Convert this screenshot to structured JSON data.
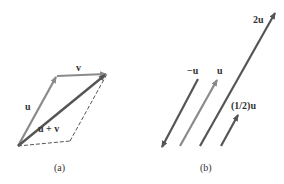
{
  "figure": {
    "panel_a": {
      "caption": "(a)",
      "labels": {
        "u": "u",
        "v": "v",
        "sum": "u + v"
      },
      "colors": {
        "u": "#8a8a8a",
        "v": "#8a8a8a",
        "sum": "#555555",
        "dashed": "#555555"
      }
    },
    "panel_b": {
      "caption": "(b)",
      "labels": {
        "neg_u": "−u",
        "u": "u",
        "two_u": "2u",
        "half_u": "(1/2)u"
      },
      "colors": {
        "neg_u": "#555555",
        "u": "#8a8a8a",
        "two_u": "#555555",
        "half_u": "#555555"
      }
    }
  }
}
